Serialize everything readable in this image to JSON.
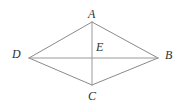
{
  "figure": {
    "type": "geometry-diagram",
    "shape": "rhombus-with-diagonals",
    "background_color": "#ffffff",
    "line_color": "#8a8a8a",
    "label_color": "#2f2f2f",
    "canvas": {
      "width": 181,
      "height": 108
    },
    "vertices": [
      {
        "id": "A",
        "label": "A",
        "x": 92,
        "y": 22,
        "role": "top-vertex"
      },
      {
        "id": "D",
        "label": "D",
        "x": 29,
        "y": 58,
        "role": "left-vertex"
      },
      {
        "id": "B",
        "label": "B",
        "x": 158,
        "y": 58,
        "role": "right-vertex"
      },
      {
        "id": "C",
        "label": "C",
        "x": 92,
        "y": 85,
        "role": "bottom-vertex"
      },
      {
        "id": "E",
        "label": "E",
        "x": 92,
        "y": 58,
        "role": "diagonal-intersection"
      }
    ],
    "edges": [
      {
        "id": "DA",
        "from": "D",
        "to": "A",
        "kind": "side"
      },
      {
        "id": "AB",
        "from": "A",
        "to": "B",
        "kind": "side"
      },
      {
        "id": "BC",
        "from": "B",
        "to": "C",
        "kind": "side"
      },
      {
        "id": "CD",
        "from": "C",
        "to": "D",
        "kind": "side"
      },
      {
        "id": "DB",
        "from": "D",
        "to": "B",
        "kind": "diagonal"
      },
      {
        "id": "AC",
        "from": "A",
        "to": "C",
        "kind": "diagonal"
      }
    ],
    "labels": {
      "a": "A",
      "b": "B",
      "c": "C",
      "d": "D",
      "e": "E"
    }
  }
}
